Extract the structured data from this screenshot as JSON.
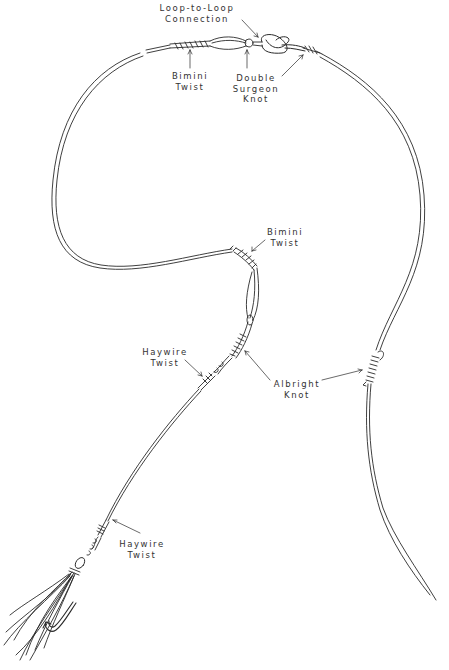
{
  "diagram": {
    "stroke_color": "#222222",
    "background": "#ffffff",
    "labels": [
      {
        "id": "loop-to-loop",
        "lines": [
          "Loop-to-Loop",
          "Connection"
        ]
      },
      {
        "id": "bimini-twist-top",
        "lines": [
          "Bimini",
          "Twist"
        ]
      },
      {
        "id": "double-surgeon-knot",
        "lines": [
          "Double",
          "Surgeon",
          "Knot"
        ]
      },
      {
        "id": "bimini-twist-middle",
        "lines": [
          "Bimini",
          "Twist"
        ]
      },
      {
        "id": "haywire-twist-upper",
        "lines": [
          "Haywire",
          "Twist"
        ]
      },
      {
        "id": "albright-knot",
        "lines": [
          "Albright",
          "Knot"
        ]
      },
      {
        "id": "haywire-twist-lower",
        "lines": [
          "Haywire",
          "Twist"
        ]
      }
    ]
  }
}
